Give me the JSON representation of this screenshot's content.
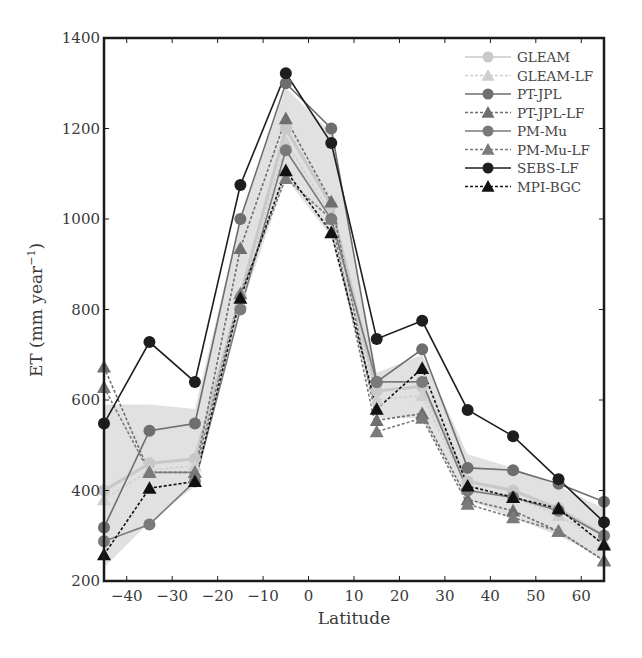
{
  "chart_data": {
    "type": "line",
    "title": "",
    "xlabel": "Latitude",
    "ylabel": "ET (mm year⁻¹)",
    "xlim": [
      -45,
      65
    ],
    "ylim": [
      200,
      1400
    ],
    "grid": false,
    "legend_position": "upper right",
    "x_ticks": [
      -40,
      -30,
      -20,
      -10,
      0,
      10,
      20,
      30,
      40,
      50,
      60
    ],
    "x_tick_labels": [
      "−40",
      "−30",
      "−20",
      "−10",
      "0",
      "10",
      "20",
      "30",
      "40",
      "50",
      "60"
    ],
    "y_ticks": [
      200,
      400,
      600,
      800,
      1000,
      1200,
      1400
    ],
    "y_tick_labels": [
      "200",
      "400",
      "600",
      "800",
      "1000",
      "1200",
      "1400"
    ],
    "x": [
      -45,
      -35,
      -25,
      -15,
      -5,
      5,
      15,
      25,
      35,
      45,
      55,
      65
    ],
    "shaded_band": {
      "description": "grey spread envelope across products",
      "upper": [
        590,
        590,
        580,
        1000,
        1290,
        1190,
        660,
        700,
        480,
        450,
        410,
        360
      ],
      "lower": [
        230,
        330,
        410,
        800,
        1090,
        960,
        560,
        560,
        380,
        340,
        300,
        250
      ]
    },
    "series": [
      {
        "name": "GLEAM",
        "marker": "circle",
        "line": "solid",
        "color": "#c8c8c8",
        "values": [
          400,
          460,
          470,
          830,
          1200,
          1030,
          620,
          630,
          420,
          400,
          360,
          300
        ]
      },
      {
        "name": "GLEAM-LF",
        "marker": "triangle",
        "line": "dotted",
        "color": "#cfcfcf",
        "values": [
          380,
          445,
          455,
          815,
          1170,
          1010,
          600,
          610,
          405,
          385,
          345,
          285
        ]
      },
      {
        "name": "PT-JPL",
        "marker": "circle",
        "line": "solid",
        "color": "#6e6e6e",
        "values": [
          318,
          532,
          548,
          1000,
          1300,
          1200,
          640,
          712,
          450,
          445,
          415,
          375
        ]
      },
      {
        "name": "PT-JPL-LF",
        "marker": "triangle",
        "line": "dotted",
        "color": "#6e6e6e",
        "values": [
          673,
          440,
          440,
          935,
          1222,
          1038,
          555,
          570,
          380,
          355,
          310,
          245
        ]
      },
      {
        "name": "PM-Mu",
        "marker": "circle",
        "line": "solid",
        "color": "#7a7a7a",
        "values": [
          288,
          325,
          420,
          800,
          1152,
          1000,
          640,
          640,
          400,
          385,
          355,
          300
        ]
      },
      {
        "name": "PM-Mu-LF",
        "marker": "triangle",
        "line": "dotted",
        "color": "#7a7a7a",
        "values": [
          628,
          440,
          440,
          835,
          1090,
          1000,
          530,
          560,
          370,
          340,
          310,
          245
        ]
      },
      {
        "name": "SEBS-LF",
        "marker": "circle",
        "line": "solid",
        "color": "#1e1e1e",
        "values": [
          548,
          728,
          640,
          1075,
          1322,
          1168,
          735,
          775,
          578,
          520,
          425,
          330
        ]
      },
      {
        "name": "MPI-BGC",
        "marker": "triangle",
        "line": "dotted",
        "color": "#111111",
        "values": [
          258,
          405,
          420,
          825,
          1107,
          970,
          580,
          670,
          410,
          385,
          360,
          280
        ]
      }
    ]
  }
}
